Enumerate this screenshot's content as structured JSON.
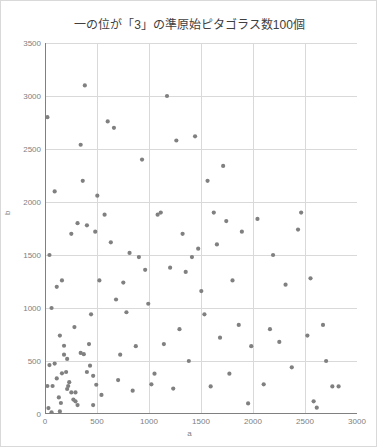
{
  "chart_data": {
    "type": "scatter",
    "title": "一の位が「3」の準原始ピタゴラス数100個",
    "xlabel": "a",
    "ylabel": "b",
    "xlim": [
      0,
      3000
    ],
    "ylim": [
      0,
      3500
    ],
    "xticks": [
      0,
      500,
      1000,
      1500,
      2000,
      2500,
      3000
    ],
    "yticks": [
      0,
      500,
      1000,
      1500,
      2000,
      2500,
      3000,
      3500
    ],
    "grid": true,
    "legend": "none",
    "marker_color": "#808080",
    "axis_color": "#808080",
    "gridline_color": "#d9d9d9",
    "points": [
      [
        63,
        16
      ],
      [
        33,
        56
      ],
      [
        133,
        156
      ],
      [
        153,
        104
      ],
      [
        213,
        236
      ],
      [
        23,
        264
      ],
      [
        43,
        462
      ],
      [
        73,
        264
      ],
      [
        93,
        476
      ],
      [
        113,
        336
      ],
      [
        143,
        24
      ],
      [
        163,
        384
      ],
      [
        183,
        644
      ],
      [
        203,
        396
      ],
      [
        223,
        264
      ],
      [
        253,
        204
      ],
      [
        273,
        136
      ],
      [
        293,
        204
      ],
      [
        313,
        84
      ],
      [
        343,
        576
      ],
      [
        373,
        564
      ],
      [
        403,
        396
      ],
      [
        433,
        456
      ],
      [
        463,
        84
      ],
      [
        493,
        276
      ],
      [
        23,
        2800
      ],
      [
        43,
        1500
      ],
      [
        63,
        1000
      ],
      [
        93,
        2100
      ],
      [
        113,
        1200
      ],
      [
        143,
        740
      ],
      [
        163,
        1260
      ],
      [
        183,
        560
      ],
      [
        213,
        520
      ],
      [
        233,
        300
      ],
      [
        253,
        1700
      ],
      [
        283,
        820
      ],
      [
        293,
        120
      ],
      [
        313,
        1800
      ],
      [
        343,
        2540
      ],
      [
        363,
        2200
      ],
      [
        383,
        3100
      ],
      [
        403,
        1780
      ],
      [
        423,
        660
      ],
      [
        443,
        940
      ],
      [
        463,
        360
      ],
      [
        483,
        1720
      ],
      [
        503,
        2060
      ],
      [
        523,
        1260
      ],
      [
        543,
        180
      ],
      [
        573,
        1880
      ],
      [
        603,
        2760
      ],
      [
        633,
        1620
      ],
      [
        663,
        2700
      ],
      [
        683,
        1080
      ],
      [
        703,
        320
      ],
      [
        723,
        560
      ],
      [
        753,
        1240
      ],
      [
        783,
        960
      ],
      [
        813,
        1520
      ],
      [
        843,
        220
      ],
      [
        873,
        640
      ],
      [
        903,
        1480
      ],
      [
        933,
        2400
      ],
      [
        963,
        1360
      ],
      [
        993,
        1040
      ],
      [
        1023,
        280
      ],
      [
        1053,
        380
      ],
      [
        1083,
        1880
      ],
      [
        1113,
        1900
      ],
      [
        1143,
        660
      ],
      [
        1173,
        3000
      ],
      [
        1203,
        1380
      ],
      [
        1233,
        240
      ],
      [
        1263,
        2580
      ],
      [
        1293,
        800
      ],
      [
        1323,
        1700
      ],
      [
        1353,
        1340
      ],
      [
        1383,
        500
      ],
      [
        1413,
        1480
      ],
      [
        1443,
        2620
      ],
      [
        1473,
        1560
      ],
      [
        1503,
        1160
      ],
      [
        1533,
        940
      ],
      [
        1563,
        2200
      ],
      [
        1593,
        260
      ],
      [
        1623,
        1900
      ],
      [
        1653,
        1600
      ],
      [
        1683,
        720
      ],
      [
        1713,
        2340
      ],
      [
        1743,
        1820
      ],
      [
        1773,
        380
      ],
      [
        1803,
        1260
      ],
      [
        1863,
        840
      ],
      [
        1893,
        1720
      ],
      [
        1953,
        100
      ],
      [
        1983,
        640
      ],
      [
        2043,
        1840
      ],
      [
        2103,
        280
      ],
      [
        2163,
        800
      ],
      [
        2193,
        1500
      ],
      [
        2253,
        680
      ],
      [
        2313,
        1220
      ],
      [
        2373,
        440
      ],
      [
        2433,
        1740
      ],
      [
        2463,
        1900
      ],
      [
        2523,
        740
      ],
      [
        2553,
        1280
      ],
      [
        2583,
        120
      ],
      [
        2613,
        60
      ],
      [
        2673,
        840
      ],
      [
        2703,
        500
      ],
      [
        2763,
        260
      ],
      [
        2823,
        260
      ]
    ]
  }
}
